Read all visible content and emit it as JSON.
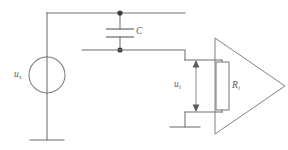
{
  "figure": {
    "name": "amplifier-input-circuit",
    "background_color": "#ffffff",
    "line_color": "#6e6e6e",
    "label_color": "#5d5d5d",
    "width": 288,
    "height": 150
  },
  "labels": {
    "source": {
      "symbol": "u",
      "subscript": "s"
    },
    "capacitor": {
      "symbol": "C",
      "subscript": ""
    },
    "input_voltage": {
      "symbol": "u",
      "subscript": "i"
    },
    "input_resistance": {
      "symbol": "R",
      "subscript": "i"
    }
  },
  "components": {
    "voltage_source": {
      "type": "ac-source-circle",
      "cx": 47,
      "cy": 75,
      "r": 18
    },
    "capacitor": {
      "type": "capacitor-parallel-plates",
      "x": 120,
      "plate_top_y": 29,
      "plate_bottom_y": 37,
      "plate_half_width": 14
    },
    "resistor": {
      "type": "resistor-rectangle",
      "x": 216,
      "y": 62,
      "width": 13,
      "height": 48
    },
    "amplifier": {
      "type": "triangle-amplifier",
      "left_x": 215,
      "top_y": 38,
      "bottom_y": 134,
      "apex_x": 285,
      "apex_y": 86
    },
    "ground_left": {
      "x": 47,
      "y": 140
    },
    "ground_right": {
      "x": 185,
      "y": 127
    }
  },
  "nodes": [
    {
      "name": "capacitor-top-node",
      "x": 120,
      "y": 13
    },
    {
      "name": "capacitor-bottom-node",
      "x": 120,
      "y": 50
    }
  ]
}
